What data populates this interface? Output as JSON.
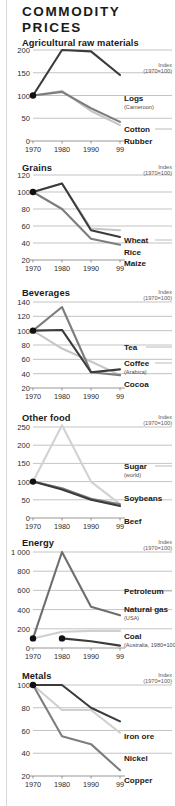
{
  "header": {
    "title": "COMMODITY PRICES"
  },
  "common": {
    "index_note": "Index (1970=100)",
    "index_note_line1": "Index",
    "index_note_line2": "(1970=100)",
    "x_ticks": [
      "1970",
      "1980",
      "1990",
      "99"
    ]
  },
  "chart_data": [
    {
      "type": "line",
      "title": "Agricultural raw materials",
      "ylabel": "Index (1970=100)",
      "xlabel": "",
      "x": [
        1970,
        1980,
        1990,
        1999
      ],
      "xtick_labels": [
        "1970",
        "1980",
        "1990",
        "99"
      ],
      "yticks": [
        0,
        50,
        100,
        150,
        200
      ],
      "ylim": [
        0,
        200
      ],
      "grid": true,
      "legend_position": "right-inline",
      "series": [
        {
          "name": "Logs",
          "sub": "(Cameroon)",
          "color": "#3b3b3b",
          "values": [
            100,
            200,
            197,
            145
          ]
        },
        {
          "name": "Cotton",
          "sub": "",
          "color": "#7d7d7d",
          "values": [
            100,
            108,
            72,
            42
          ]
        },
        {
          "name": "Rubber",
          "sub": "",
          "color": "#c6c6c6",
          "values": [
            100,
            110,
            66,
            35
          ]
        }
      ]
    },
    {
      "type": "line",
      "title": "Grains",
      "ylabel": "Index (1970=100)",
      "xlabel": "",
      "x": [
        1970,
        1980,
        1990,
        1999
      ],
      "xtick_labels": [
        "1970",
        "1980",
        "1990",
        "99"
      ],
      "yticks": [
        20,
        40,
        60,
        80,
        100,
        120
      ],
      "ylim": [
        20,
        120
      ],
      "grid": true,
      "legend_position": "right-inline",
      "series": [
        {
          "name": "Wheat",
          "sub": "",
          "color": "#c6c6c6",
          "values": [
            100,
            110,
            57,
            55
          ]
        },
        {
          "name": "Rice",
          "sub": "",
          "color": "#3b3b3b",
          "values": [
            100,
            110,
            55,
            47
          ]
        },
        {
          "name": "Maize",
          "sub": "",
          "color": "#7d7d7d",
          "values": [
            100,
            80,
            45,
            38
          ]
        }
      ]
    },
    {
      "type": "line",
      "title": "Beverages",
      "ylabel": "Index (1970=100)",
      "xlabel": "",
      "x": [
        1970,
        1980,
        1990,
        1999
      ],
      "xtick_labels": [
        "1970",
        "1980",
        "1990",
        "99"
      ],
      "yticks": [
        20,
        40,
        60,
        80,
        100,
        120,
        140
      ],
      "ylim": [
        20,
        140
      ],
      "grid": true,
      "legend_position": "right-inline",
      "series": [
        {
          "name": "Tea",
          "sub": "",
          "color": "#7d7d7d",
          "values": [
            100,
            133,
            42,
            38
          ]
        },
        {
          "name": "Coffee",
          "sub": "(Arabica)",
          "color": "#3b3b3b",
          "values": [
            100,
            101,
            42,
            46
          ]
        },
        {
          "name": "Cocoa",
          "sub": "",
          "color": "#c6c6c6",
          "values": [
            100,
            75,
            57,
            38
          ]
        }
      ]
    },
    {
      "type": "line",
      "title": "Other food",
      "ylabel": "Index (1970=100)",
      "xlabel": "",
      "x": [
        1970,
        1980,
        1990,
        1999
      ],
      "xtick_labels": [
        "1970",
        "1980",
        "1990",
        "99"
      ],
      "yticks": [
        0,
        50,
        100,
        150,
        200,
        250
      ],
      "ylim": [
        0,
        250
      ],
      "grid": true,
      "legend_position": "right-inline",
      "series": [
        {
          "name": "Sugar",
          "sub": "(world)",
          "color": "#d2d2d2",
          "values": [
            100,
            255,
            100,
            38
          ]
        },
        {
          "name": "Soybeans",
          "sub": "",
          "color": "#7d7d7d",
          "values": [
            100,
            82,
            53,
            38
          ]
        },
        {
          "name": "Beef",
          "sub": "",
          "color": "#3b3b3b",
          "values": [
            100,
            78,
            50,
            33
          ]
        }
      ]
    },
    {
      "type": "line",
      "title": "Energy",
      "ylabel": "Index (1970=100)",
      "xlabel": "",
      "x": [
        1970,
        1980,
        1990,
        1999
      ],
      "xtick_labels": [
        "1970",
        "1980",
        "1990",
        "99"
      ],
      "yticks": [
        0,
        200,
        400,
        600,
        800,
        1000
      ],
      "ytick_labels": [
        "0",
        "200",
        "400",
        "600",
        "800",
        "1 000"
      ],
      "ylim": [
        0,
        1000
      ],
      "grid": true,
      "legend_position": "right-inline",
      "series": [
        {
          "name": "Petroleum",
          "sub": "",
          "color": "#6e6e6e",
          "values": [
            100,
            1000,
            430,
            340
          ]
        },
        {
          "name": "Natural gas",
          "sub": "(USA)",
          "color": "#cfcfcf",
          "values": [
            100,
            170,
            178,
            178
          ]
        },
        {
          "name": "Coal",
          "sub": "(Australia, 1980=100)",
          "color": "#3b3b3b",
          "values": [
            null,
            100,
            70,
            25
          ]
        }
      ]
    },
    {
      "type": "line",
      "title": "Metals",
      "ylabel": "Index (1970=100)",
      "xlabel": "",
      "x": [
        1970,
        1980,
        1990,
        1999
      ],
      "xtick_labels": [
        "1970",
        "1980",
        "1990",
        "99"
      ],
      "yticks": [
        20,
        40,
        60,
        80,
        100
      ],
      "ylim": [
        20,
        100
      ],
      "grid": true,
      "legend_position": "right-inline",
      "series": [
        {
          "name": "Iron ore",
          "sub": "",
          "color": "#3b3b3b",
          "values": [
            100,
            100,
            80,
            68
          ]
        },
        {
          "name": "Nickel",
          "sub": "",
          "color": "#cfcfcf",
          "values": [
            100,
            78,
            78,
            58
          ]
        },
        {
          "name": "Copper",
          "sub": "",
          "color": "#7d7d7d",
          "values": [
            100,
            55,
            48,
            25
          ]
        }
      ]
    }
  ],
  "panels": [
    {
      "id": "agricultural-raw-materials",
      "top": 38,
      "height": 122,
      "plot": {
        "x0": 33,
        "x1": 120,
        "y0": 12,
        "y1": 103,
        "gridRight": 172
      },
      "labels": [
        {
          "key": "logs",
          "text": "Logs",
          "sub": "(Cameroon)",
          "x": 124,
          "y": 57,
          "leader": null
        },
        {
          "key": "cotton",
          "text": "Cotton",
          "sub": "",
          "x": 124,
          "y": 88,
          "leader": {
            "x1": 155,
            "x2": 172,
            "y": 91
          }
        },
        {
          "key": "rubber",
          "text": "Rubber",
          "sub": "",
          "x": 124,
          "y": 100,
          "leader": null
        }
      ],
      "note": {
        "x": 172,
        "y": 24
      }
    },
    {
      "id": "grains",
      "top": 163,
      "height": 122,
      "plot": {
        "x0": 33,
        "x1": 120,
        "y0": 12,
        "y1": 97,
        "gridRight": 172
      },
      "labels": [
        {
          "key": "wheat",
          "text": "Wheat",
          "sub": "",
          "x": 124,
          "y": 74,
          "leader": {
            "x1": 155,
            "x2": 172,
            "y": 77
          }
        },
        {
          "key": "rice",
          "text": "Rice",
          "sub": "",
          "x": 124,
          "y": 86,
          "leader": null
        },
        {
          "key": "maize",
          "text": "Maize",
          "sub": "",
          "x": 124,
          "y": 97,
          "leader": null
        }
      ],
      "note": {
        "x": 172,
        "y": 1
      }
    },
    {
      "id": "beverages",
      "top": 288,
      "height": 122,
      "plot": {
        "x0": 33,
        "x1": 120,
        "y0": 14,
        "y1": 100,
        "gridRight": 172
      },
      "labels": [
        {
          "key": "tea",
          "text": "Tea",
          "sub": "",
          "x": 124,
          "y": 56,
          "leader": {
            "x1": 146,
            "x2": 172,
            "y": 59
          }
        },
        {
          "key": "coffee",
          "text": "Coffee",
          "sub": "(Arabica)",
          "x": 124,
          "y": 72,
          "leader": {
            "x1": 155,
            "x2": 172,
            "y": 75
          }
        },
        {
          "key": "cocoa",
          "text": "Cocoa",
          "sub": "",
          "x": 124,
          "y": 93,
          "leader": null
        }
      ],
      "note": {
        "x": 172,
        "y": 1
      }
    },
    {
      "id": "other-food",
      "top": 413,
      "height": 122,
      "plot": {
        "x0": 33,
        "x1": 120,
        "y0": 14,
        "y1": 105,
        "gridRight": 172
      },
      "labels": [
        {
          "key": "sugar",
          "text": "Sugar",
          "sub": "(world)",
          "x": 124,
          "y": 50,
          "leader": {
            "x1": 155,
            "x2": 172,
            "y": 53
          }
        },
        {
          "key": "soybeans",
          "text": "Soybeans",
          "sub": "",
          "x": 124,
          "y": 82,
          "leader": null
        },
        {
          "key": "beef",
          "text": "Beef",
          "sub": "",
          "x": 124,
          "y": 105,
          "leader": null
        }
      ],
      "note": {
        "x": 172,
        "y": 1
      }
    },
    {
      "id": "energy",
      "top": 538,
      "height": 130,
      "plot": {
        "x0": 33,
        "x1": 120,
        "y0": 14,
        "y1": 110,
        "gridRight": 172
      },
      "labels": [
        {
          "key": "petroleum",
          "text": "Petroleum",
          "sub": "",
          "x": 124,
          "y": 50,
          "leader": {
            "x1": 156,
            "x2": 172,
            "y": 53
          }
        },
        {
          "key": "natural-gas",
          "text": "Natural gas",
          "sub": "(USA)",
          "x": 124,
          "y": 68,
          "leader": null
        },
        {
          "key": "coal",
          "text": "Coal",
          "sub": "(Australia, 1980=100)",
          "x": 124,
          "y": 95,
          "leader": null
        }
      ],
      "note": {
        "x": 172,
        "y": 1
      }
    },
    {
      "id": "metals",
      "top": 671,
      "height": 126,
      "plot": {
        "x0": 33,
        "x1": 120,
        "y0": 14,
        "y1": 105,
        "gridRight": 172
      },
      "labels": [
        {
          "key": "iron-ore",
          "text": "Iron ore",
          "sub": "",
          "x": 124,
          "y": 62,
          "leader": null
        },
        {
          "key": "nickel",
          "text": "Nickel",
          "sub": "",
          "x": 124,
          "y": 84,
          "leader": null
        },
        {
          "key": "copper",
          "text": "Copper",
          "sub": "",
          "x": 124,
          "y": 106,
          "leader": null
        }
      ],
      "note": {
        "x": 172,
        "y": 1
      }
    }
  ]
}
